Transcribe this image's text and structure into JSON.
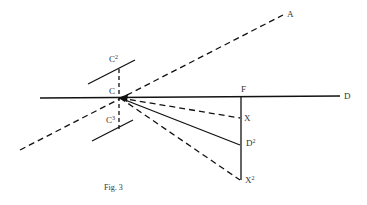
{
  "figure": {
    "caption": "Fig. 3",
    "labels": {
      "A": "A",
      "C": "C",
      "C2_base": "C",
      "C2_sup": "2",
      "C3_base": "C",
      "C3_sup": "3",
      "F": "F",
      "D": "D",
      "X": "X",
      "D2_base": "D",
      "D2_sup": "2",
      "X2_base": "X",
      "X2_sup": "2"
    },
    "lines": [
      {
        "name": "line-CD",
        "style": "solid",
        "from": "C",
        "to": "D"
      },
      {
        "name": "line-CA",
        "style": "dashed",
        "from": "lower-left",
        "to": "A"
      },
      {
        "name": "line-FX2",
        "style": "solid",
        "from": "F",
        "to": "X2"
      },
      {
        "name": "line-CX",
        "style": "dashed",
        "from": "C",
        "to": "X"
      },
      {
        "name": "line-CD2",
        "style": "solid",
        "from": "C",
        "to": "D2"
      },
      {
        "name": "line-CX2",
        "style": "dashed",
        "from": "C",
        "to": "X2"
      },
      {
        "name": "line-C2",
        "style": "solid",
        "label": "C2"
      },
      {
        "name": "line-C3",
        "style": "solid",
        "label": "C3"
      },
      {
        "name": "line-C2C3",
        "style": "dashed",
        "from": "C2",
        "to": "C3"
      }
    ]
  }
}
